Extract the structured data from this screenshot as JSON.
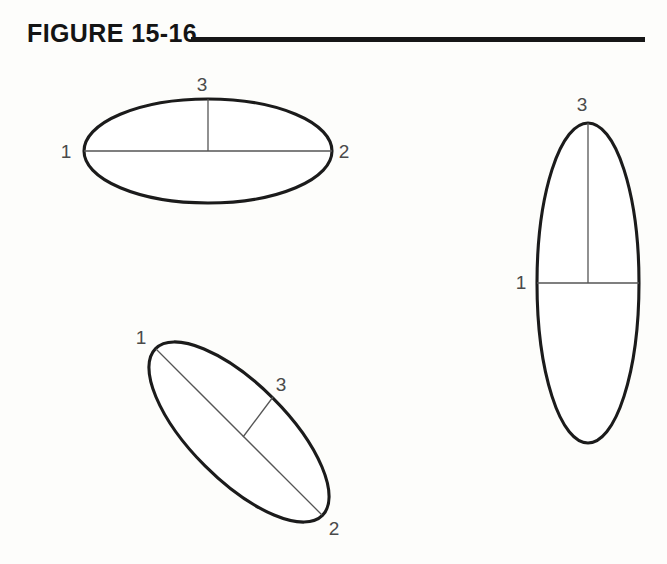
{
  "figure": {
    "title": "FIGURE 15-16",
    "rule_color": "#171717",
    "outline_color": "#1b1b1b",
    "axis_color": "#555555",
    "label_color": "#4a4a4a",
    "background": "#fdfdfb"
  },
  "diagrams": [
    {
      "id": "horizontal-ellipse",
      "orientation": "horizontal",
      "center": {
        "x": 208,
        "y": 151
      },
      "semi_major": 124,
      "semi_minor": 52,
      "rotation_deg": 0,
      "labels": [
        {
          "name": "1",
          "x": 66,
          "y": 158
        },
        {
          "name": "2",
          "x": 344,
          "y": 158
        },
        {
          "name": "3",
          "x": 202,
          "y": 91
        }
      ],
      "axes": [
        {
          "name": "major-axis",
          "x1": 84,
          "y1": 151,
          "x2": 332,
          "y2": 151
        },
        {
          "name": "minor-axis",
          "x1": 208,
          "y1": 99,
          "x2": 208,
          "y2": 151
        }
      ]
    },
    {
      "id": "tilted-ellipse",
      "orientation": "tilted",
      "center": {
        "x": 239,
        "y": 432
      },
      "semi_major": 118,
      "semi_minor": 48,
      "rotation_deg": 45,
      "labels": [
        {
          "name": "1",
          "x": 141,
          "y": 344
        },
        {
          "name": "2",
          "x": 334,
          "y": 535
        },
        {
          "name": "3",
          "x": 281,
          "y": 391
        }
      ],
      "axes": [
        {
          "name": "major-axis",
          "x1": 156,
          "y1": 349,
          "x2": 322,
          "y2": 515
        },
        {
          "name": "minor-axis",
          "x1": 243,
          "y1": 437,
          "x2": 273,
          "y2": 397
        }
      ]
    },
    {
      "id": "vertical-ellipse",
      "orientation": "vertical",
      "center": {
        "x": 588,
        "y": 283
      },
      "semi_major": 160,
      "semi_minor": 51,
      "rotation_deg": 90,
      "labels": [
        {
          "name": "1",
          "x": 521,
          "y": 289
        },
        {
          "name": "3",
          "x": 582,
          "y": 111
        }
      ],
      "axes": [
        {
          "name": "minor-axis",
          "x1": 537,
          "y1": 283,
          "x2": 639,
          "y2": 283
        },
        {
          "name": "major-axis",
          "x1": 588,
          "y1": 123,
          "x2": 588,
          "y2": 283
        }
      ]
    }
  ]
}
